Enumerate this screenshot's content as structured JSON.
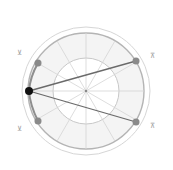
{
  "diagram": {
    "type": "polar-clock-diagram",
    "center": [
      86,
      91
    ],
    "rings": [
      {
        "radius": 64,
        "color": "#d6d6d6",
        "width": 1
      },
      {
        "radius": 58,
        "color": "#b4b4b4",
        "width": 1.4
      },
      {
        "radius": 33,
        "color": "#c8c8c8",
        "width": 1
      }
    ],
    "spokes": 12,
    "spoke_color": "#d2d2d2",
    "fill_color": "#f3f3f3",
    "corner_labels": {
      "top_left": "⊻",
      "top_right": "⊼",
      "bottom_left": "⊻",
      "bottom_right": "⊼"
    },
    "points": [
      {
        "name": "active",
        "x": 29,
        "y": 91,
        "color": "#111111",
        "r": 4
      },
      {
        "name": "upper-left",
        "x": 38,
        "y": 63,
        "color": "#8a8a8a",
        "r": 3.5
      },
      {
        "name": "lower-left",
        "x": 38,
        "y": 121,
        "color": "#8a8a8a",
        "r": 3.5
      },
      {
        "name": "upper-right",
        "x": 136,
        "y": 61,
        "color": "#8a8a8a",
        "r": 3.5
      },
      {
        "name": "lower-right",
        "x": 136,
        "y": 122,
        "color": "#8a8a8a",
        "r": 3.5
      }
    ],
    "line_color": "#6a6a6a",
    "arc_color": "#8e8e8e"
  }
}
